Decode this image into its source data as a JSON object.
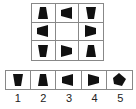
{
  "puzzle": {
    "grid": [
      [
        "trapezoid-up",
        "trapezoid-left",
        "trapezoid-down"
      ],
      [
        "trapezoid-left",
        "",
        "trapezoid-right"
      ],
      [
        "trapezoid-down",
        "trapezoid-right",
        "trapezoid-up"
      ]
    ],
    "options": [
      {
        "label": "1",
        "shape": "trapezoid-down"
      },
      {
        "label": "2",
        "shape": "trapezoid-up"
      },
      {
        "label": "3",
        "shape": "trapezoid-left"
      },
      {
        "label": "4",
        "shape": "trapezoid-right"
      },
      {
        "label": "5",
        "shape": "trapezoid-rotated-diamond"
      }
    ],
    "shape_color": "#111111",
    "border_color": "#888888"
  }
}
